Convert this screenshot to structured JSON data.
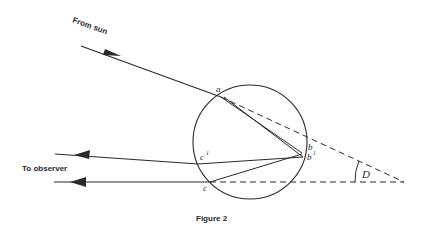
{
  "diagram": {
    "caption": "Figure 2",
    "labels": {
      "from_sun": "From sun",
      "to_observer": "To observer",
      "point_a": "a",
      "point_b": "b",
      "point_b1": "b",
      "point_b1_sup": "1",
      "point_c": "c",
      "point_c1": "c",
      "point_c1_sup": "1",
      "angle": "D"
    },
    "colors": {
      "ink": "#2a2a2a",
      "background": "#ffffff"
    }
  }
}
